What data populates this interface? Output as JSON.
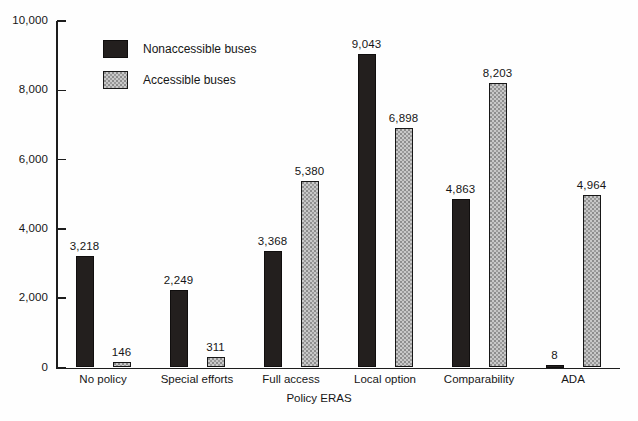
{
  "chart_data": {
    "type": "bar",
    "title": "",
    "subtitle": "",
    "xlabel": "Policy ERAS",
    "ylabel": "",
    "ylim": [
      0,
      10000
    ],
    "ytick_values": [
      0,
      2000,
      4000,
      6000,
      8000,
      10000
    ],
    "ytick_labels": [
      "0",
      "2,000",
      "4,000",
      "6,000",
      "8,000",
      "10,000"
    ],
    "grid": false,
    "legend_position": "upper-left-inside",
    "categories": [
      "No policy",
      "Special efforts",
      "Full access",
      "Local option",
      "Comparability",
      "ADA"
    ],
    "series": [
      {
        "name": "Nonaccessible buses",
        "color": "#231f1e",
        "values": [
          3218,
          2249,
          3368,
          9043,
          4863,
          8
        ],
        "value_labels": [
          "3,218",
          "2,249",
          "3,368",
          "9,043",
          "4,863",
          "8"
        ]
      },
      {
        "name": "Accessible buses",
        "color": "#c8c8c8",
        "values": [
          146,
          311,
          5380,
          6898,
          8203,
          4964
        ],
        "value_labels": [
          "146",
          "311",
          "5,380",
          "6,898",
          "8,203",
          "4,964"
        ]
      }
    ]
  },
  "legend": {
    "items": [
      {
        "label": "Nonaccessible buses",
        "swatch": "solid-black"
      },
      {
        "label": "Accessible buses",
        "swatch": "stippled-gray"
      }
    ]
  }
}
